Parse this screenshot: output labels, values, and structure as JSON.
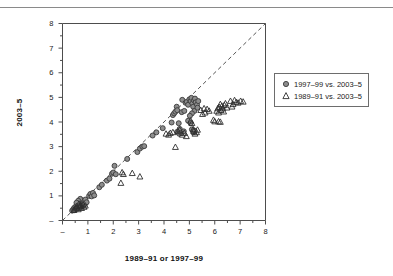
{
  "chart_data": {
    "type": "scatter",
    "title": "",
    "xlabel": "1989–91 or 1997–99",
    "ylabel": "2003–5",
    "xlim": [
      0,
      8
    ],
    "ylim": [
      0,
      8
    ],
    "grid": false,
    "legend_position": "right",
    "xticks": [
      "–",
      "1",
      "2",
      "3",
      "4",
      "5",
      "6",
      "7",
      "8"
    ],
    "yticks": [
      "–",
      "1",
      "2",
      "3",
      "4",
      "5",
      "6",
      "7",
      "8"
    ],
    "xtick_values": [
      0,
      1,
      2,
      3,
      4,
      5,
      6,
      7,
      8
    ],
    "ytick_values": [
      0,
      1,
      2,
      3,
      4,
      5,
      6,
      7,
      8
    ],
    "minor_ticks": true,
    "annotations": [
      {
        "name": "identity-line",
        "type": "dashed-line",
        "from": [
          0,
          0
        ],
        "to": [
          8,
          8
        ]
      }
    ],
    "series": [
      {
        "name": "1997–99 vs. 2003–5",
        "marker": "circle",
        "fill": "#8d8d8d",
        "stroke": "#3a3a3a",
        "points": [
          [
            0.38,
            0.4
          ],
          [
            0.42,
            0.45
          ],
          [
            0.45,
            0.5
          ],
          [
            0.48,
            0.42
          ],
          [
            0.5,
            0.55
          ],
          [
            0.52,
            0.48
          ],
          [
            0.55,
            0.6
          ],
          [
            0.58,
            0.52
          ],
          [
            0.6,
            0.65
          ],
          [
            0.62,
            0.58
          ],
          [
            0.65,
            0.7
          ],
          [
            0.68,
            0.62
          ],
          [
            0.7,
            0.75
          ],
          [
            0.72,
            0.55
          ],
          [
            0.75,
            0.68
          ],
          [
            0.78,
            0.8
          ],
          [
            0.8,
            0.72
          ],
          [
            0.82,
            0.6
          ],
          [
            0.85,
            0.78
          ],
          [
            0.88,
            0.66
          ],
          [
            0.9,
            0.85
          ],
          [
            0.95,
            0.74
          ],
          [
            0.7,
            0.88
          ],
          [
            0.62,
            0.8
          ],
          [
            0.55,
            0.72
          ],
          [
            1.05,
            1.0
          ],
          [
            1.1,
            1.08
          ],
          [
            1.15,
            0.98
          ],
          [
            1.2,
            1.12
          ],
          [
            1.25,
            1.02
          ],
          [
            1.45,
            1.35
          ],
          [
            1.55,
            1.45
          ],
          [
            1.75,
            1.62
          ],
          [
            1.85,
            1.7
          ],
          [
            1.95,
            1.9
          ],
          [
            2.0,
            1.95
          ],
          [
            2.05,
            2.22
          ],
          [
            2.1,
            1.88
          ],
          [
            2.55,
            2.5
          ],
          [
            2.95,
            2.78
          ],
          [
            3.05,
            2.92
          ],
          [
            3.15,
            3.0
          ],
          [
            3.22,
            3.02
          ],
          [
            3.55,
            3.45
          ],
          [
            3.7,
            3.58
          ],
          [
            3.95,
            3.75
          ],
          [
            4.3,
            3.98
          ],
          [
            4.35,
            4.28
          ],
          [
            4.4,
            4.35
          ],
          [
            4.45,
            4.42
          ],
          [
            4.5,
            4.62
          ],
          [
            4.52,
            4.48
          ],
          [
            4.58,
            3.95
          ],
          [
            4.62,
            3.72
          ],
          [
            4.7,
            4.4
          ],
          [
            4.72,
            4.9
          ],
          [
            4.8,
            4.45
          ],
          [
            4.85,
            4.78
          ],
          [
            4.9,
            4.82
          ],
          [
            4.95,
            4.7
          ],
          [
            5.0,
            4.92
          ],
          [
            5.05,
            4.85
          ],
          [
            5.08,
            4.98
          ],
          [
            5.12,
            4.75
          ],
          [
            5.15,
            4.62
          ],
          [
            5.18,
            4.88
          ],
          [
            5.2,
            4.45
          ],
          [
            5.22,
            4.95
          ],
          [
            5.25,
            4.8
          ],
          [
            5.3,
            4.7
          ],
          [
            5.32,
            4.58
          ],
          [
            5.35,
            4.85
          ],
          [
            5.1,
            4.35
          ],
          [
            5.02,
            4.25
          ],
          [
            4.95,
            4.05
          ],
          [
            4.52,
            3.6
          ],
          [
            4.6,
            3.52
          ],
          [
            4.68,
            3.55
          ],
          [
            4.78,
            3.62
          ],
          [
            5.05,
            3.95
          ],
          [
            5.1,
            3.7
          ],
          [
            5.15,
            3.58
          ],
          [
            5.2,
            3.65
          ]
        ]
      },
      {
        "name": "1989–91 vs. 2003–5",
        "marker": "triangle",
        "fill": "#8d8d8d",
        "stroke": "#3a3a3a",
        "points": [
          [
            0.45,
            0.42
          ],
          [
            0.52,
            0.48
          ],
          [
            0.58,
            0.52
          ],
          [
            0.62,
            0.45
          ],
          [
            0.68,
            0.58
          ],
          [
            0.72,
            0.62
          ],
          [
            0.75,
            0.5
          ],
          [
            0.8,
            0.65
          ],
          [
            0.85,
            0.55
          ],
          [
            0.9,
            0.6
          ],
          [
            0.65,
            0.68
          ],
          [
            0.55,
            0.58
          ],
          [
            2.3,
            1.52
          ],
          [
            2.35,
            1.95
          ],
          [
            2.4,
            1.88
          ],
          [
            2.75,
            1.92
          ],
          [
            3.05,
            1.78
          ],
          [
            4.08,
            3.52
          ],
          [
            4.18,
            3.48
          ],
          [
            4.25,
            3.55
          ],
          [
            4.35,
            3.58
          ],
          [
            4.45,
            2.98
          ],
          [
            4.55,
            3.62
          ],
          [
            4.62,
            3.68
          ],
          [
            4.72,
            3.48
          ],
          [
            4.8,
            3.55
          ],
          [
            4.88,
            3.42
          ],
          [
            5.05,
            4.05
          ],
          [
            5.1,
            3.95
          ],
          [
            5.15,
            3.7
          ],
          [
            5.18,
            3.62
          ],
          [
            5.22,
            3.52
          ],
          [
            5.28,
            3.58
          ],
          [
            5.32,
            3.68
          ],
          [
            5.45,
            4.48
          ],
          [
            5.52,
            4.32
          ],
          [
            5.58,
            4.55
          ],
          [
            5.62,
            4.38
          ],
          [
            5.7,
            4.52
          ],
          [
            5.78,
            4.45
          ],
          [
            5.95,
            4.08
          ],
          [
            6.0,
            4.02
          ],
          [
            6.08,
            4.45
          ],
          [
            6.12,
            4.55
          ],
          [
            6.15,
            4.38
          ],
          [
            6.18,
            4.6
          ],
          [
            6.22,
            4.72
          ],
          [
            6.25,
            4.48
          ],
          [
            6.28,
            4.65
          ],
          [
            6.32,
            4.55
          ],
          [
            6.35,
            4.42
          ],
          [
            6.38,
            4.68
          ],
          [
            6.42,
            4.75
          ],
          [
            6.48,
            4.58
          ],
          [
            6.62,
            4.85
          ],
          [
            6.68,
            4.62
          ],
          [
            6.72,
            4.72
          ],
          [
            6.78,
            4.88
          ],
          [
            6.85,
            4.8
          ],
          [
            6.92,
            4.78
          ],
          [
            7.02,
            4.85
          ],
          [
            7.12,
            4.82
          ],
          [
            6.15,
            4.02
          ],
          [
            6.22,
            4.0
          ]
        ]
      }
    ]
  },
  "axis_titles": {
    "x": "1989–91 or 1997–99",
    "y": "2003–5"
  },
  "legend": {
    "entries": [
      {
        "label": "1997–99 vs. 2003–5",
        "marker": "circle"
      },
      {
        "label": "1989–91 vs. 2003–5",
        "marker": "triangle"
      }
    ]
  },
  "colors": {
    "marker_fill": "#8d8d8d",
    "marker_stroke": "#3a3a3a",
    "axis": "#4d4d4d",
    "rule": "#8a8a8a"
  }
}
